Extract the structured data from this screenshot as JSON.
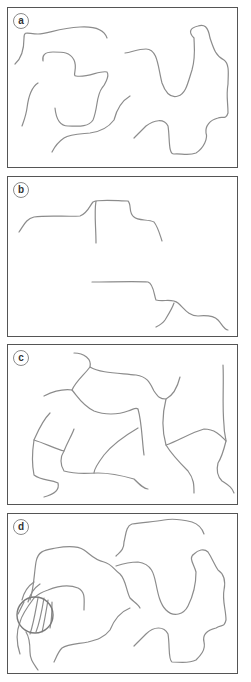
{
  "figure": {
    "panels": [
      {
        "id": "a",
        "label": "a",
        "content": "disconnected meandering curves"
      },
      {
        "id": "b",
        "label": "b",
        "content": "two stepped profile lines with branching vertical strokes"
      },
      {
        "id": "c",
        "label": "c",
        "content": "network of connected curved segments"
      },
      {
        "id": "d",
        "label": "d",
        "content": "meandering curves with circled hatched region"
      }
    ],
    "colors": {
      "border": "#555555",
      "line": "#8c8c8c",
      "circle": "#7a7a7a",
      "background": "#ffffff"
    }
  }
}
